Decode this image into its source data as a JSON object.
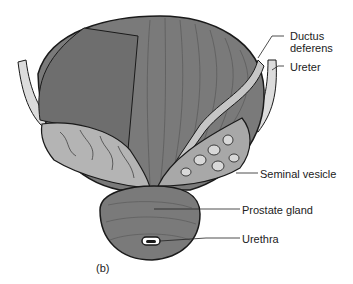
{
  "figure": {
    "panel_label": "(b)",
    "colors": {
      "bladder": "#7a7a7a",
      "vesicle": "#b4b4b4",
      "outline": "#1a1a1a",
      "ureter": "#d8d8d8",
      "background": "#ffffff"
    },
    "labels": [
      {
        "id": "ductus",
        "line1": "Ductus",
        "line2": "deferens"
      },
      {
        "id": "ureter",
        "line1": "Ureter"
      },
      {
        "id": "seminal",
        "line1": "Seminal vesicle"
      },
      {
        "id": "prostate",
        "line1": "Prostate gland"
      },
      {
        "id": "urethra",
        "line1": "Urethra"
      }
    ]
  }
}
